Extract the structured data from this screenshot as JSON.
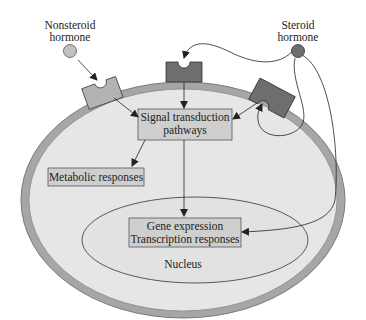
{
  "labels": {
    "nonsteroid_line1": "Nonsteroid",
    "nonsteroid_line2": "hormone",
    "steroid_line1": "Steroid",
    "steroid_line2": "hormone",
    "signal_line1": "Signal transduction",
    "signal_line2": "pathways",
    "metabolic": "Metabolic responses",
    "gene_line1": "Gene expression",
    "gene_line2": "Transcription responses",
    "nucleus": "Nucleus"
  },
  "colors": {
    "cytoplasm": "#e6e6e6",
    "membrane": "#a6a6a6",
    "membrane_edge": "#7a7a7a",
    "nonsteroid_receptor": "#b3b3b3",
    "steroid_receptor": "#6e6e6e",
    "nonsteroid_hormone": "#c0c0c0",
    "steroid_hormone": "#6e6e6e",
    "box_fill": "#cfcfcf"
  }
}
